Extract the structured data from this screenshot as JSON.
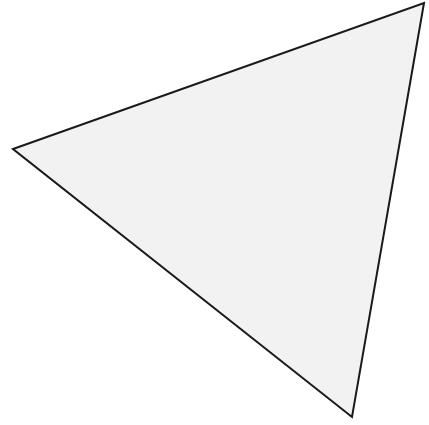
{
  "canvas": {
    "width": 429,
    "height": 425,
    "background": "#ffffff"
  },
  "shape": {
    "type": "triangle",
    "points": "13,149 424,3 352,417",
    "fill": "#f2f2f2",
    "stroke": "#1a1a1a",
    "stroke_width": 2
  }
}
